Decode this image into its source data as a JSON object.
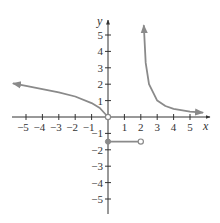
{
  "chart_data": {
    "type": "line",
    "title": "",
    "xlabel": "x",
    "ylabel": "y",
    "xlim": [
      -6,
      6
    ],
    "ylim": [
      -6,
      6
    ],
    "grid": false,
    "x_ticks": [
      -5,
      -4,
      -3,
      -2,
      -1,
      1,
      2,
      3,
      4,
      5
    ],
    "y_ticks": [
      -5,
      -4,
      -3,
      -2,
      -1,
      1,
      2,
      3,
      4,
      5
    ],
    "x_tick_labels": [
      "−5",
      "−4",
      "−3",
      "−2",
      "−1",
      "1",
      "2",
      "3",
      "4",
      "5"
    ],
    "y_tick_labels": [
      "−5",
      "−4",
      "−3",
      "−2",
      "−1",
      "1",
      "2",
      "3",
      "4",
      "5"
    ],
    "series": [
      {
        "name": "left branch (x < 0)",
        "description": "increasing toward left, arrow at left end, open circle at origin",
        "x": [
          -5.8,
          -5,
          -4,
          -3,
          -2,
          -1,
          -0.5,
          0
        ],
        "y": [
          2.05,
          1.9,
          1.7,
          1.5,
          1.25,
          0.85,
          0.55,
          0
        ],
        "start_marker": "arrow",
        "end_marker": "open-circle"
      },
      {
        "name": "middle segment (0 ≤ x < 2)",
        "description": "horizontal line y = -1.5",
        "x": [
          0,
          2
        ],
        "y": [
          -1.5,
          -1.5
        ],
        "start_marker": "closed-circle",
        "end_marker": "open-circle"
      },
      {
        "name": "right branch (x > 2)",
        "description": "vertical asymptote at x = 2, decays toward 0",
        "x": [
          2.18,
          2.3,
          2.5,
          3,
          3.5,
          4,
          5,
          5.8
        ],
        "y": [
          5.6,
          3.3,
          2.0,
          1.0,
          0.67,
          0.5,
          0.33,
          0.26
        ],
        "start_marker": "arrow",
        "end_marker": "arrow"
      }
    ],
    "colors": {
      "curve": "#8a8a8a",
      "axes": "#333333"
    }
  }
}
